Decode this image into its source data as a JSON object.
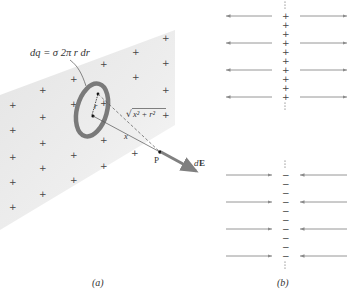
{
  "panel_a": {
    "caption": "(a)",
    "charge_label": "dq = σ 2π r dr",
    "radius_label": "r",
    "distance_label": "x",
    "hypotenuse_label": "√(x² + r²)",
    "hyp_sqrt": "√",
    "hyp_body": "x² + r²",
    "point_label": "P",
    "field_label": "dE",
    "field_d": "d",
    "field_E": "E",
    "plus_positions": [
      [
        165,
        38
      ],
      [
        135,
        52
      ],
      [
        103,
        64
      ],
      [
        165,
        63
      ],
      [
        135,
        77
      ],
      [
        42,
        90
      ],
      [
        73,
        79
      ],
      [
        73,
        104
      ],
      [
        12,
        105
      ],
      [
        42,
        117
      ],
      [
        103,
        103
      ],
      [
        165,
        90
      ],
      [
        12,
        130
      ],
      [
        42,
        143
      ],
      [
        103,
        140
      ],
      [
        165,
        115
      ],
      [
        12,
        157
      ],
      [
        73,
        155
      ],
      [
        42,
        168
      ],
      [
        134,
        153
      ],
      [
        103,
        166
      ],
      [
        73,
        180
      ],
      [
        12,
        182
      ],
      [
        42,
        194
      ],
      [
        12,
        207
      ]
    ]
  },
  "panel_b": {
    "caption": "(b)",
    "upper": {
      "sign": "+",
      "rows_y": [
        16,
        43,
        70,
        97
      ],
      "direction": "outward"
    },
    "lower": {
      "sign": "−",
      "rows_y": [
        175,
        202,
        229,
        256
      ],
      "direction": "inward"
    }
  },
  "colors": {
    "shading": "#e9e9e9",
    "ring": "#7a7a7a",
    "arrow": "#8a8a8a",
    "field_vector": "#808080",
    "text": "#333333"
  }
}
